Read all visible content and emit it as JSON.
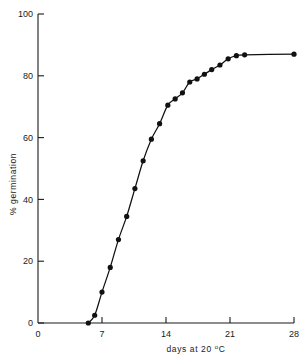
{
  "chart_data": {
    "type": "line",
    "title": "",
    "xlabel": "days at 20 °C",
    "xlabel_parts": {
      "pre": "days at 20 ",
      "sup": "o",
      "post": "C"
    },
    "ylabel": "% germination",
    "xlim": [
      0,
      28
    ],
    "ylim": [
      0,
      100
    ],
    "xticks": [
      0,
      7,
      14,
      21,
      28
    ],
    "xtick_labels": [
      "0",
      "7",
      "14",
      "21",
      "28"
    ],
    "yticks": [
      0,
      20,
      40,
      60,
      80,
      100
    ],
    "ytick_labels": [
      "0",
      "20",
      "40",
      "60",
      "80",
      "100"
    ],
    "grid": false,
    "legend": "none",
    "marker": "filled-circle",
    "series": [
      {
        "name": "% germination",
        "x": [
          5.5,
          6.2,
          7.0,
          7.9,
          8.8,
          9.7,
          10.6,
          11.5,
          12.4,
          13.3,
          14.2,
          15.0,
          15.8,
          16.6,
          17.4,
          18.2,
          19.0,
          19.9,
          20.8,
          21.7,
          22.6,
          28.0
        ],
        "values": [
          0,
          2.5,
          10,
          18,
          27,
          34.5,
          43.5,
          52.5,
          59.5,
          64.5,
          70.5,
          72.5,
          74.5,
          78,
          79,
          80.5,
          82,
          83.5,
          85.5,
          86.5,
          86.8,
          87
        ]
      }
    ]
  }
}
